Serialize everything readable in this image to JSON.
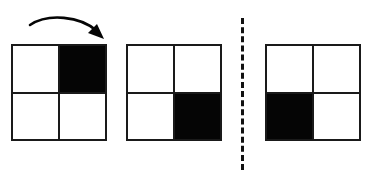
{
  "diagram": {
    "background_color": "#ffffff",
    "ink_color": "#050505",
    "grid_line_color": "#1a1a1a",
    "canvas": {
      "width": 381,
      "height": 182
    }
  },
  "arrow": {
    "name": "rotation-arrow",
    "label": "rotation arrow",
    "direction": "clockwise",
    "start": {
      "x": 30,
      "y": 25
    },
    "end": {
      "x": 102,
      "y": 37
    },
    "stroke_color": "#050505",
    "path": "M30,25 C48,13 80,16 97,31",
    "head_points": "97,24 104,39 88,33"
  },
  "divider": {
    "name": "dashed-divider",
    "label": "dashed separator",
    "x": 241,
    "y_top": 18,
    "y_bottom": 170,
    "style": "dashed",
    "color": "#111111",
    "width_px": 3
  },
  "grids": [
    {
      "id": "grid-1",
      "name": "grid-first",
      "label": "Figure 1",
      "x": 11,
      "y": 44,
      "width": 96,
      "height": 97,
      "filled_cell": "top-right",
      "cells": [
        {
          "position": "top-left",
          "fill": "white"
        },
        {
          "position": "top-right",
          "fill": "black"
        },
        {
          "position": "bottom-left",
          "fill": "white"
        },
        {
          "position": "bottom-right",
          "fill": "white"
        }
      ]
    },
    {
      "id": "grid-2",
      "name": "grid-second",
      "label": "Figure 2",
      "x": 126,
      "y": 44,
      "width": 96,
      "height": 97,
      "filled_cell": "bottom-right",
      "cells": [
        {
          "position": "top-left",
          "fill": "white"
        },
        {
          "position": "top-right",
          "fill": "white"
        },
        {
          "position": "bottom-left",
          "fill": "white"
        },
        {
          "position": "bottom-right",
          "fill": "black"
        }
      ]
    },
    {
      "id": "grid-3",
      "name": "grid-third",
      "label": "Figure 3",
      "x": 265,
      "y": 44,
      "width": 96,
      "height": 97,
      "filled_cell": "bottom-left",
      "cells": [
        {
          "position": "top-left",
          "fill": "white"
        },
        {
          "position": "top-right",
          "fill": "white"
        },
        {
          "position": "bottom-left",
          "fill": "black"
        },
        {
          "position": "bottom-right",
          "fill": "white"
        }
      ]
    }
  ]
}
